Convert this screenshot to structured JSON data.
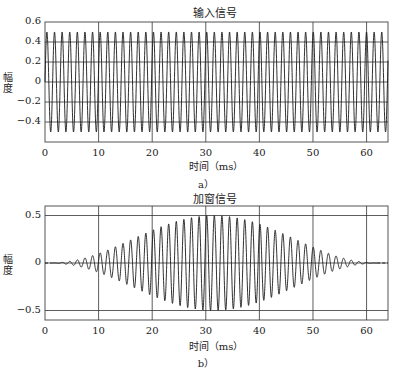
{
  "chart_data": [
    {
      "type": "line",
      "panel": "a",
      "title": "输入信号",
      "xlabel": "时间（ms）",
      "ylabel": "幅度",
      "caption": "a）",
      "xlim": [
        0,
        64
      ],
      "ylim": [
        -0.6,
        0.6
      ],
      "xticks": [
        0,
        10,
        20,
        30,
        40,
        50,
        60
      ],
      "yticks": [
        0.6,
        0.4,
        0.2,
        0,
        -0.2,
        -0.4
      ],
      "ytick_labels": [
        "0.6",
        "0.4",
        "0.2",
        "0",
        "-0.2",
        "-0.4"
      ],
      "grid": true,
      "series": [
        {
          "name": "input",
          "description": "constant-amplitude sinusoid",
          "amplitude": 0.5,
          "period_ms": 1.42,
          "x_range": [
            0,
            64
          ]
        }
      ]
    },
    {
      "type": "line",
      "panel": "b",
      "title": "加窗信号",
      "xlabel": "时间（ms）",
      "ylabel": "幅度",
      "caption": "b）",
      "xlim": [
        0,
        64
      ],
      "ylim": [
        -0.6,
        0.6
      ],
      "xticks": [
        0,
        10,
        20,
        30,
        40,
        50,
        60
      ],
      "yticks": [
        0.5,
        0,
        -0.5
      ],
      "ytick_labels": [
        "0.5",
        "0",
        "-0.5"
      ],
      "grid": true,
      "series": [
        {
          "name": "windowed",
          "description": "sinusoid multiplied by Hann window, zero outside window",
          "amplitude_peak": 0.5,
          "period_ms": 1.42,
          "window": "hann",
          "window_range_ms": [
            1,
            62
          ],
          "window_center_ms": 32
        }
      ]
    }
  ],
  "panels": {
    "a": {
      "title": "输入信号",
      "ylabel": "幅度",
      "xlabel": "时间（ms）",
      "caption": "a）"
    },
    "b": {
      "title": "加窗信号",
      "ylabel": "幅度",
      "xlabel": "时间（ms）",
      "caption": "b）"
    }
  },
  "colors": {
    "line": "#1a1a1a",
    "grid": "#333333",
    "frame": "#555555"
  }
}
